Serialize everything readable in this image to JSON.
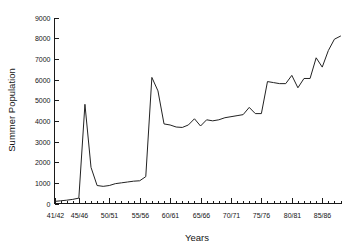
{
  "chart_data": {
    "type": "line",
    "title": "",
    "xlabel": "Years",
    "ylabel": "Summer Population",
    "ylim": [
      0,
      9000
    ],
    "xlim": [
      1941,
      1988
    ],
    "grid": false,
    "legend": null,
    "y_ticks": [
      0,
      1000,
      2000,
      3000,
      4000,
      5000,
      6000,
      7000,
      8000,
      9000
    ],
    "y_tick_labels": [
      "0",
      "1000",
      "2000",
      "3000",
      "4000",
      "5000",
      "6000",
      "7000",
      "8000",
      "9000"
    ],
    "x_tick_labels": [
      "41/42",
      "45/46",
      "50/51",
      "55/56",
      "60/61",
      "65/66",
      "70/71",
      "75/76",
      "80/81",
      "85/86"
    ],
    "x_tick_values": [
      1941,
      1945,
      1950,
      1955,
      1960,
      1965,
      1970,
      1975,
      1980,
      1985
    ],
    "x_minor_tick_interval": 1,
    "series": [
      {
        "name": "Summer Population",
        "x": [
          1941,
          1942,
          1943,
          1944,
          1945,
          1946,
          1947,
          1948,
          1949,
          1950,
          1951,
          1952,
          1953,
          1954,
          1955,
          1956,
          1957,
          1958,
          1959,
          1960,
          1961,
          1962,
          1963,
          1964,
          1965,
          1966,
          1967,
          1968,
          1969,
          1970,
          1971,
          1972,
          1973,
          1974,
          1975,
          1976,
          1977,
          1978,
          1979,
          1980,
          1981,
          1982,
          1983,
          1984,
          1985,
          1986,
          1987,
          1988
        ],
        "values": [
          100,
          130,
          160,
          200,
          260,
          4800,
          1750,
          870,
          830,
          870,
          960,
          1000,
          1040,
          1080,
          1100,
          1300,
          6100,
          5450,
          3850,
          3800,
          3700,
          3680,
          3800,
          4100,
          3750,
          4050,
          4000,
          4050,
          4150,
          4200,
          4250,
          4300,
          4650,
          4350,
          4350,
          5900,
          5850,
          5800,
          5800,
          6200,
          5600,
          6050,
          6050,
          7050,
          6600,
          7400,
          7950,
          8100
        ]
      }
    ]
  },
  "axis": {
    "y_label": "Summer Population",
    "x_label": "Years"
  }
}
